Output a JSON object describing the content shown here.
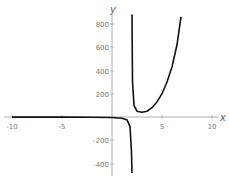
{
  "chart_data": {
    "type": "line",
    "title": "",
    "xlabel": "x",
    "ylabel": "y",
    "xlim": [
      -10.5,
      10.5
    ],
    "ylim": [
      -480,
      880
    ],
    "x_ticks": [
      -10,
      -5,
      5,
      10
    ],
    "y_ticks": [
      -400,
      -200,
      200,
      400,
      600,
      800
    ],
    "x_tick_labels": [
      "-10",
      "-5",
      "5",
      "10"
    ],
    "y_tick_labels": [
      "-400",
      "-200",
      "200",
      "400",
      "600",
      "800"
    ],
    "vertical_asymptote": 2,
    "series": [
      {
        "name": "left branch",
        "x": [
          -10,
          -5,
          -2,
          0,
          1,
          1.5,
          1.8,
          1.95,
          2
        ],
        "y": [
          -1,
          -1,
          -2,
          -4,
          -10,
          -25,
          -80,
          -300,
          -480
        ]
      },
      {
        "name": "right branch",
        "x": [
          2,
          2.05,
          2.2,
          2.5,
          3,
          3.5,
          4,
          4.5,
          5,
          5.5,
          6,
          6.5,
          6.9
        ],
        "y": [
          880,
          300,
          100,
          50,
          40,
          50,
          80,
          130,
          200,
          300,
          430,
          620,
          860
        ]
      }
    ],
    "grid": false,
    "legend": "none"
  },
  "labels": {
    "x_axis": "x",
    "y_axis": "y",
    "xt": [
      "-10",
      "-5",
      "5",
      "10"
    ],
    "yt": [
      "800",
      "600",
      "400",
      "200",
      "-200",
      "-400"
    ]
  }
}
